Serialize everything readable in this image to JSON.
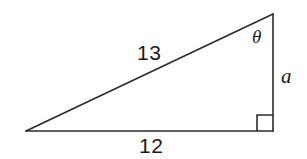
{
  "figure": {
    "type": "right-triangle-diagram",
    "background_color": "#ffffff",
    "stroke_color": "#2b2b2b",
    "labels": {
      "hypotenuse": "13",
      "base": "12",
      "opposite": "a",
      "angle": "θ"
    },
    "geometry": {
      "left_vertex": [
        26,
        131
      ],
      "top_vertex": [
        273,
        14
      ],
      "right_angle_vertex": [
        273,
        131
      ],
      "right_angle_marker": {
        "x": 257,
        "y": 115,
        "size": 16
      }
    }
  }
}
